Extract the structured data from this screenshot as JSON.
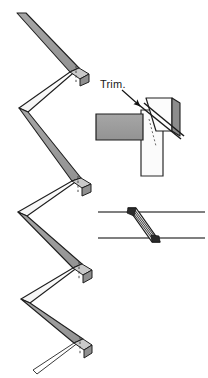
{
  "figure": {
    "background_color": "#ffffff",
    "width": 208,
    "height": 378
  },
  "annotations": {
    "trim_label": "Trim."
  },
  "colors": {
    "face_gray": "#9a9a9a",
    "face_gray_light": "#b8b8b8",
    "face_white": "#fdfdfd",
    "edge_dark": "#1f1f1f",
    "edge_mid": "#4a4a4a",
    "cap_gray": "#8f8f8f",
    "hatch_line": "#2a2a2a",
    "section_line": "#555555",
    "dashed_hidden": "#3a3a3a"
  },
  "panels": {
    "zigzag": {
      "name": "Zigzag folded strip isometric view",
      "segments": [
        {
          "id": 1,
          "face": "gray",
          "from_x": 18,
          "from_y": 16,
          "to_x": 70,
          "to_y": 66
        },
        {
          "id": 2,
          "face": "white",
          "from_x": 70,
          "from_y": 66,
          "to_x": 20,
          "to_y": 110
        },
        {
          "id": 3,
          "face": "gray",
          "from_x": 20,
          "from_y": 110,
          "to_x": 72,
          "to_y": 175
        },
        {
          "id": 4,
          "face": "white",
          "from_x": 72,
          "from_y": 175,
          "to_x": 18,
          "to_y": 212
        },
        {
          "id": 5,
          "face": "gray",
          "from_x": 18,
          "from_y": 212,
          "to_x": 74,
          "to_y": 262
        },
        {
          "id": 6,
          "face": "white",
          "from_x": 74,
          "from_y": 262,
          "to_x": 22,
          "to_y": 300
        },
        {
          "id": 7,
          "face": "gray",
          "from_x": 22,
          "from_y": 300,
          "to_x": 74,
          "to_y": 338
        },
        {
          "id": 8,
          "face": "outline",
          "from_x": 74,
          "from_y": 338,
          "to_x": 34,
          "to_y": 372
        }
      ],
      "end_caps": [
        {
          "id": "cap-top",
          "x": 70,
          "y": 66,
          "has_hidden_line": true
        },
        {
          "id": "cap-middle",
          "x": 72,
          "y": 175,
          "has_hidden_line": true
        },
        {
          "id": "cap-lower",
          "x": 74,
          "y": 262,
          "has_hidden_line": true
        },
        {
          "id": "cap-bottom",
          "x": 74,
          "y": 338,
          "has_hidden_line": true
        }
      ],
      "strip_thickness": 9
    },
    "trim_detail": {
      "name": "Trim joint detail with callout",
      "horizontal_member": {
        "x": 96,
        "y": 112,
        "width": 48,
        "height": 26,
        "fill": "gray"
      },
      "vertical_member": {
        "x": 144,
        "y": 104,
        "width": 22,
        "height": 72,
        "fill": "white"
      },
      "trim_piece": {
        "description": "Triangular wedge trimmed at diagonal",
        "fill": "white",
        "shadow_fill": "gray"
      },
      "cut_line": {
        "from_x": 140,
        "from_y": 106,
        "to_x": 180,
        "to_y": 148,
        "style": "double-diagonal"
      },
      "callout_arrow": {
        "from_x": 124,
        "from_y": 92,
        "to_x": 141,
        "to_y": 107
      }
    },
    "section_detail": {
      "name": "Scarf joint cross-section",
      "top_line": {
        "x1": 98,
        "y1": 212,
        "x2": 204,
        "y2": 212
      },
      "bottom_line": {
        "x1": 98,
        "y1": 238,
        "x2": 204,
        "y2": 238
      },
      "scarf_cut": {
        "top_x": 128,
        "bottom_x": 152,
        "hatch_count": 4,
        "description": "Diagonal hatched scarf cut through member"
      }
    }
  }
}
